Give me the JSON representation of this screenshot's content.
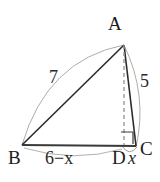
{
  "figure": {
    "kind": "geometry-diagram",
    "background_color": "#ffffff",
    "stroke_color": "#262626",
    "arc_color": "#a8a8a8",
    "dash_color": "#9a9a9a"
  },
  "vertices": {
    "A": {
      "label": "A",
      "x": 124,
      "y": 44
    },
    "B": {
      "label": "B",
      "x": 22,
      "y": 145
    },
    "C": {
      "label": "C",
      "x": 136,
      "y": 146
    },
    "D": {
      "label": "D",
      "x": 124,
      "y": 145
    }
  },
  "measurements": {
    "side_ab": "7",
    "side_ac": "5",
    "segment_bd": "6−x",
    "segment_dc": "x"
  },
  "markers": {
    "right_angle_at_d": "right-angle"
  }
}
